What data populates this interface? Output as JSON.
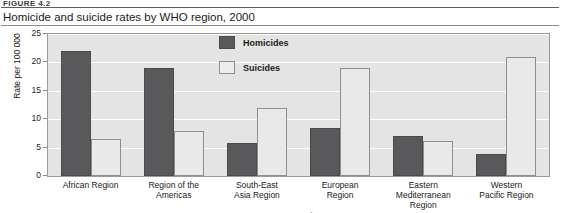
{
  "figure": {
    "number_label": "FIGURE 4.2",
    "title": "Homicide and suicide rates by WHO region, 2000"
  },
  "legend": {
    "position": "inside-top-center",
    "entries": [
      {
        "label": "Homicides",
        "color": "#59595b",
        "icon": "filled-square-swatch"
      },
      {
        "label": "Suicides",
        "color": "#ededed",
        "icon": "outlined-square-swatch"
      }
    ]
  },
  "axes": {
    "y": {
      "title": "Rate per 100 000",
      "ticks": [
        "0",
        "5",
        "10",
        "15",
        "20",
        "25"
      ],
      "min": 0,
      "max": 25
    },
    "x": {
      "title": "WHO region"
    }
  },
  "chart_data": {
    "type": "bar",
    "title": "Homicide and suicide rates by WHO region, 2000",
    "xlabel": "WHO region",
    "ylabel": "Rate per 100 000",
    "ylim": [
      0,
      25
    ],
    "ytick_step": 5,
    "grid": true,
    "legend_position": "inside-top-center",
    "categories": [
      "African Region",
      "Region of the\nAmericas",
      "South-East\nAsia Region",
      "European\nRegion",
      "Eastern\nMediterranean\nRegion",
      "Western\nPacific Region"
    ],
    "series": [
      {
        "name": "Homicides",
        "color": "#59595b",
        "values": [
          22.0,
          19.1,
          5.8,
          8.5,
          7.1,
          3.8
        ]
      },
      {
        "name": "Suicides",
        "color": "#ededed",
        "values": [
          6.6,
          7.9,
          12.0,
          19.1,
          6.1,
          21.0
        ]
      }
    ]
  }
}
